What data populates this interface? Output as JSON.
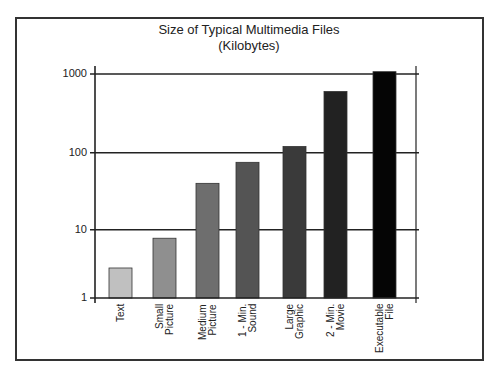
{
  "chart_data": {
    "type": "bar",
    "title": "Size of Typical Multimedia Files",
    "subtitle": "(Kilobytes)",
    "xlabel": "",
    "ylabel": "",
    "yscale": "log",
    "ylim": [
      1,
      1000
    ],
    "yticks": [
      1,
      10,
      100,
      1000
    ],
    "ytick_labels": [
      "1",
      "10",
      "100",
      "1000"
    ],
    "grid": true,
    "legend": null,
    "categories": [
      "Text",
      "Small Picture",
      "Medium Picture",
      "1 - Min. Sound",
      "Large Graphic",
      "2 - Min. Movie",
      "Executable File"
    ],
    "category_label_lines": [
      [
        "Text"
      ],
      [
        "Small",
        "Picture"
      ],
      [
        "Medium",
        "Picture"
      ],
      [
        "1 - Min.",
        "Sound"
      ],
      [
        "Large",
        "Graphic"
      ],
      [
        "2 - Min.",
        "Movie"
      ],
      [
        "Executable",
        "File"
      ]
    ],
    "values": [
      2.75,
      7.5,
      40,
      75,
      120,
      600,
      1070
    ],
    "colors": [
      "#c0c0c0",
      "#8f8f8f",
      "#6e6e6e",
      "#545454",
      "#3a3a3a",
      "#222222",
      "#050505"
    ]
  }
}
